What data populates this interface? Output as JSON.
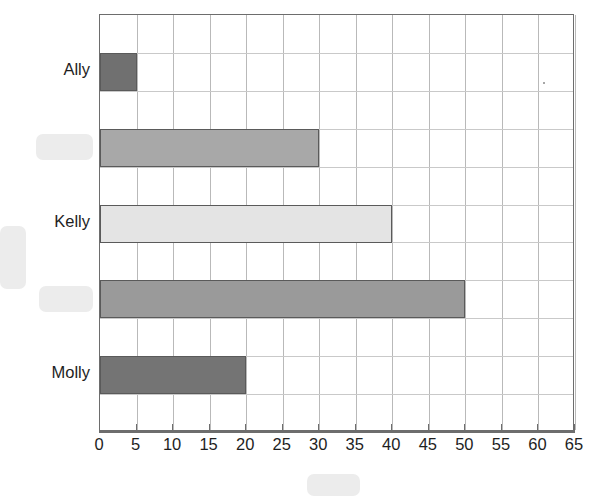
{
  "chart_data": {
    "type": "bar",
    "orientation": "horizontal",
    "title": "",
    "xlabel": "",
    "ylabel": "",
    "categories": [
      "Molly",
      "",
      "Kelly",
      "",
      "Ally"
    ],
    "values": [
      20,
      50,
      40,
      30,
      5
    ],
    "bar_colors": [
      "#747474",
      "#9a9a9a",
      "#e4e4e4",
      "#a8a8a8",
      "#707070"
    ],
    "xlim": [
      0,
      65
    ],
    "xticks": [
      0,
      5,
      10,
      15,
      20,
      25,
      30,
      35,
      40,
      45,
      50,
      55,
      60,
      65
    ],
    "xtick_labels": [
      "0",
      "5",
      "10",
      "15",
      "20",
      "25",
      "30",
      "35",
      "40",
      "45",
      "50",
      "55",
      "60",
      "65"
    ],
    "grid": true,
    "legend": "none",
    "visible_category_labels": [
      "Ally",
      "Kelly",
      "Molly"
    ],
    "redacted_labels": [
      "category-label-2",
      "category-label-4",
      "y-axis-title",
      "x-axis-title"
    ]
  },
  "plot": {
    "bars": [
      {
        "name": "bar-ally",
        "label": "Ally",
        "value": 5,
        "color": "#707070",
        "row": 0,
        "label_visible": true
      },
      {
        "name": "bar-row-2",
        "label": "",
        "value": 30,
        "color": "#a8a8a8",
        "row": 1,
        "label_visible": false
      },
      {
        "name": "bar-kelly",
        "label": "Kelly",
        "value": 40,
        "color": "#e4e4e4",
        "row": 2,
        "label_visible": true
      },
      {
        "name": "bar-row-4",
        "label": "",
        "value": 50,
        "color": "#9a9a9a",
        "row": 3,
        "label_visible": false
      },
      {
        "name": "bar-molly",
        "label": "Molly",
        "value": 20,
        "color": "#747474",
        "row": 4,
        "label_visible": true
      }
    ],
    "axis_color": "#6d6d6d",
    "gridline_color": "#b9b9b9",
    "bar_edge_color": "#5a5a5a",
    "background": "#ffffff"
  },
  "redactions": [
    {
      "name": "redaction-category-label-2",
      "x": 36,
      "y": 134,
      "w": 57,
      "h": 26
    },
    {
      "name": "redaction-y-axis-title",
      "x": 0,
      "y": 226,
      "w": 26,
      "h": 63
    },
    {
      "name": "redaction-category-label-4",
      "x": 39,
      "y": 286,
      "w": 54,
      "h": 26
    },
    {
      "name": "redaction-x-axis-title",
      "x": 307,
      "y": 474,
      "w": 53,
      "h": 22
    }
  ],
  "artifacts": {
    "speck": "scan-speck-dot"
  }
}
